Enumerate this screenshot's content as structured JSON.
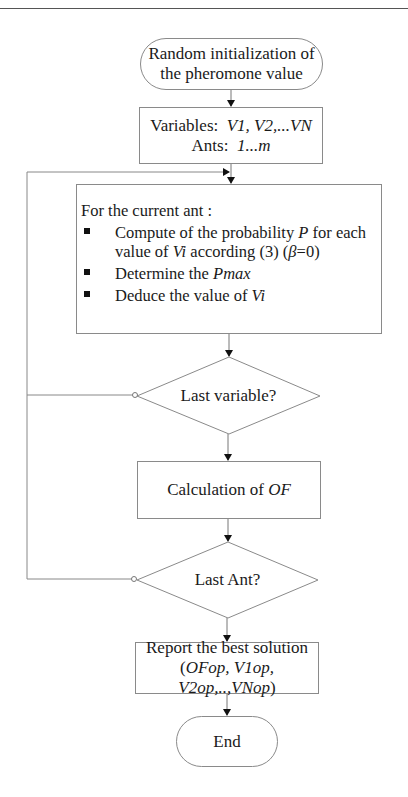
{
  "diagram": {
    "type": "flowchart",
    "nodes": {
      "start": {
        "shape": "terminator",
        "line1": "Random initialization of",
        "line2": "the pheromone value"
      },
      "init_vars": {
        "shape": "process",
        "line1_label": "Variables:",
        "line1_value": "V1, V2,...VN",
        "line2_label": "Ants:",
        "line2_value": "1...m"
      },
      "per_ant": {
        "shape": "process",
        "title": "For the current ant :",
        "steps": [
          {
            "pre": "Compute of the probability ",
            "em1": "P",
            "mid": " for each value of ",
            "em2": "Vi",
            "post": " according (3) (",
            "em3": "β",
            "tail": "=0)"
          },
          {
            "pre": "Determine the ",
            "em1": "Pmax"
          },
          {
            "pre": "Deduce the value of ",
            "em1": "Vi"
          }
        ]
      },
      "decision_var": {
        "shape": "decision",
        "label": "Last variable?"
      },
      "calc_of": {
        "shape": "process",
        "label": "Calculation of ",
        "label_em": "OF"
      },
      "decision_ant": {
        "shape": "decision",
        "label": "Last Ant?"
      },
      "report": {
        "shape": "process",
        "line1": "Report the best solution",
        "line2_open": "(",
        "line2_em": "OFop, V1op, V2op,..,VNop",
        "line2_close": ")"
      },
      "end": {
        "shape": "terminator",
        "label": "End"
      }
    },
    "edges": [
      {
        "from": "start",
        "to": "init_vars"
      },
      {
        "from": "init_vars",
        "to": "per_ant"
      },
      {
        "from": "per_ant",
        "to": "decision_var"
      },
      {
        "from": "decision_var",
        "to": "calc_of",
        "branch": "yes"
      },
      {
        "from": "decision_var",
        "to": "per_ant",
        "branch": "no (loop)"
      },
      {
        "from": "calc_of",
        "to": "decision_ant"
      },
      {
        "from": "decision_ant",
        "to": "report",
        "branch": "yes"
      },
      {
        "from": "decision_ant",
        "to": "per_ant",
        "branch": "no (loop)"
      },
      {
        "from": "report",
        "to": "end"
      }
    ],
    "colors": {
      "stroke": "#8a8a8a",
      "text": "#1a1a1a",
      "arrowhead": "#111111"
    }
  }
}
